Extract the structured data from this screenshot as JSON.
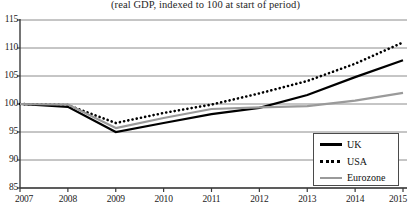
{
  "chart_data": {
    "type": "line",
    "title": "",
    "subtitle": "(real GDP, indexed to 100 at start of period)",
    "xlabel": "",
    "ylabel": "",
    "x": [
      2007,
      2008,
      2009,
      2010,
      2011,
      2012,
      2013,
      2014,
      2015
    ],
    "xtick_labels": [
      "2007",
      "2008",
      "2009",
      "2010",
      "2011",
      "2012",
      "2013",
      "2014",
      "2015"
    ],
    "ytick_labels": [
      "85",
      "90",
      "95",
      "100",
      "105",
      "110",
      "115"
    ],
    "yticks": [
      85,
      90,
      95,
      100,
      105,
      110,
      115
    ],
    "xlim": [
      2007,
      2015
    ],
    "ylim": [
      85,
      115
    ],
    "grid": "horizontal",
    "legend_position": "bottom-right",
    "series": [
      {
        "name": "UK",
        "style": "solid",
        "color": "#000000",
        "values": [
          100.0,
          99.5,
          95.0,
          96.6,
          98.2,
          99.3,
          101.6,
          104.8,
          107.8
        ]
      },
      {
        "name": "USA",
        "style": "dotted",
        "color": "#000000",
        "values": [
          100.0,
          99.8,
          96.6,
          98.4,
          99.9,
          101.9,
          104.1,
          107.2,
          111.0
        ]
      },
      {
        "name": "Eurozone",
        "style": "solid",
        "color": "#9a9a9a",
        "values": [
          100.0,
          99.9,
          95.7,
          97.5,
          99.1,
          99.4,
          99.6,
          100.6,
          102.0
        ]
      }
    ]
  },
  "legend": {
    "items": [
      {
        "label": "UK",
        "swatch": "solid-black-line"
      },
      {
        "label": "USA",
        "swatch": "dotted-black-line"
      },
      {
        "label": "Eurozone",
        "swatch": "solid-gray-line"
      }
    ]
  },
  "colors": {
    "uk": "#000000",
    "usa": "#000000",
    "eurozone": "#9a9a9a",
    "grid": "#8c8c8c",
    "axis": "#3a3a3a",
    "background": "#ffffff"
  }
}
